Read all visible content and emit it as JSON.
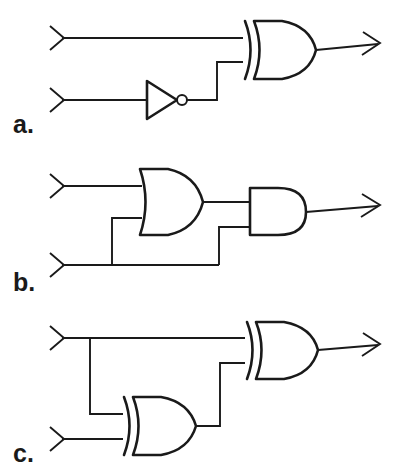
{
  "figure": {
    "background_color": "#ffffff",
    "line_color": "#1a1a1a",
    "width": 407,
    "height": 471
  },
  "panels": [
    {
      "id": "a",
      "label": "a.",
      "description": "XOR gate with top input direct and bottom input through a NOT gate",
      "gates": [
        {
          "type": "NOT",
          "name": "not-gate",
          "label": "NOT"
        },
        {
          "type": "XOR",
          "name": "xor-gate",
          "label": "XOR"
        }
      ],
      "inputs": [
        {
          "name": "input-top",
          "marker": "chevron-right-icon"
        },
        {
          "name": "input-bottom",
          "marker": "chevron-right-icon"
        }
      ],
      "output": {
        "name": "output",
        "marker": "arrow-right-icon"
      }
    },
    {
      "id": "b",
      "label": "b.",
      "description": "OR gate feeding an AND gate; bottom input branches to both gates",
      "gates": [
        {
          "type": "OR",
          "name": "or-gate",
          "label": "OR"
        },
        {
          "type": "AND",
          "name": "and-gate",
          "label": "AND"
        }
      ],
      "inputs": [
        {
          "name": "input-top",
          "marker": "chevron-right-icon"
        },
        {
          "name": "input-bottom",
          "marker": "chevron-right-icon"
        }
      ],
      "output": {
        "name": "output",
        "marker": "arrow-right-icon"
      }
    },
    {
      "id": "c",
      "label": "c.",
      "description": "Two XOR gates; top input branches to both, lower XOR output feeds upper XOR",
      "gates": [
        {
          "type": "XOR",
          "name": "xor-gate-lower",
          "label": "XOR"
        },
        {
          "type": "XOR",
          "name": "xor-gate-upper",
          "label": "XOR"
        }
      ],
      "inputs": [
        {
          "name": "input-top",
          "marker": "chevron-right-icon"
        },
        {
          "name": "input-bottom",
          "marker": "chevron-right-icon"
        }
      ],
      "output": {
        "name": "output",
        "marker": "arrow-right-icon"
      }
    }
  ]
}
